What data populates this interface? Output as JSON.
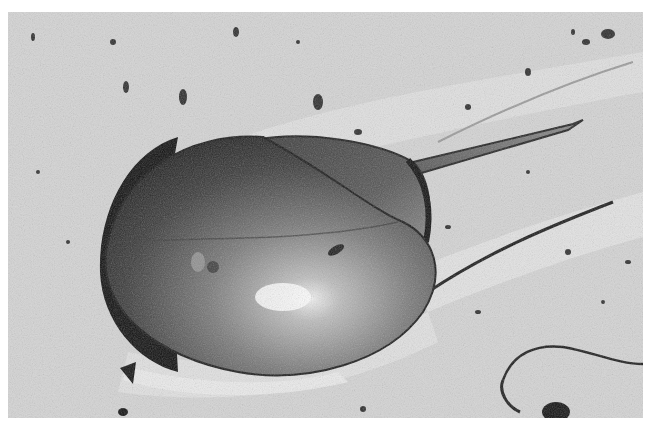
{
  "image": {
    "subject": "Horseshoe crab on sand",
    "style": "black-and-white photograph",
    "colors": {
      "background": "#ffffff",
      "sand": "#d6d6d6",
      "sand_light": "#e8e8e8",
      "shell_dark": "#2a2a2a",
      "shell_mid": "#6e6e6e",
      "shell_highlight": "#e6e6e6",
      "shadow": "#111111"
    }
  }
}
